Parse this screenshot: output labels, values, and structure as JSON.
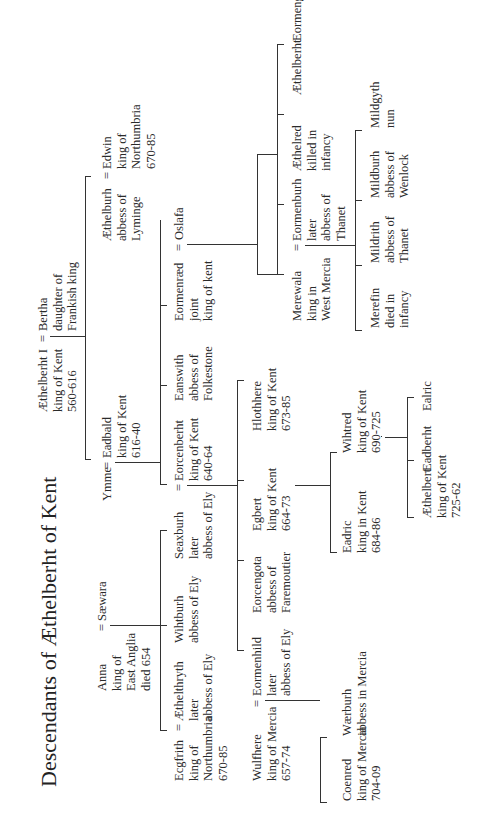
{
  "diagram": {
    "title": "Descendants of Æthelberht of Kent",
    "orientation": "rotated 90° counter-clockwise",
    "nodes": {
      "aethelberht": {
        "name": "Æthelberht I",
        "lines": "Æthelberht I\nking of Kent\n560-616"
      },
      "bertha": {
        "name": "Bertha",
        "lines": "Bertha\ndaughter of\nFrankish king"
      },
      "ymme": {
        "name": "Ymme",
        "lines": "Ymme"
      },
      "eadbald": {
        "name": "Eadbald",
        "lines": "Eadbald\nking of Kent\n616-40"
      },
      "aethelburh": {
        "name": "Æthelburh",
        "lines": "Æthelburh\nabbess of\nLyminge"
      },
      "edwin": {
        "name": "Edwin",
        "lines": "Edwin\nking of\nNorthumbria\n670-85"
      },
      "anna": {
        "name": "Anna",
        "lines": "Anna\nking of\nEast Anglia\ndied 654"
      },
      "saewara": {
        "name": "Sæwara",
        "lines": "Sæwara"
      },
      "ecgfrith": {
        "name": "Ecgfrith",
        "lines": "Ecgfrith\nking of\nNorthumbria\n670-85"
      },
      "aethelthryth": {
        "name": "Æthelthryth",
        "lines": "Æthelthryth\nlater\nabbess of Ely"
      },
      "wihtburh": {
        "name": "Wihtburh",
        "lines": "Wihtburh\nabbess of Ely"
      },
      "seaxburh": {
        "name": "Seaxburh",
        "lines": "Seaxburh\nlater\nabbess of Ely"
      },
      "eorcenberht": {
        "name": "Eorcenberht",
        "lines": "Eorcenberht\nking of Kent\n640-64"
      },
      "eanswith": {
        "name": "Eanswith",
        "lines": "Eanswith\nabbess of\nFolkestone"
      },
      "eormenraed": {
        "name": "Eormenræd",
        "lines": "Eormenræd\njoint\nking of kent"
      },
      "oslafa": {
        "name": "Oslafa",
        "lines": "Oslafa"
      },
      "wulfhere": {
        "name": "Wulfhere",
        "lines": "Wulfhere\nking of Mercia\n657-74"
      },
      "eormenhild": {
        "name": "Eormenhild",
        "lines": "Eormenhild\nlater\nabbess of Ely"
      },
      "eorcengota": {
        "name": "Eorcengota",
        "lines": "Eorcengota\nabbess of\nFaremoutier"
      },
      "egbert": {
        "name": "Egbert",
        "lines": "Egbert\nking of Kent\n664-73"
      },
      "hlothhere": {
        "name": "Hlothhere",
        "lines": "Hlothhere\nking of Kent\n673-85"
      },
      "merewala": {
        "name": "Merewala",
        "lines": "Merewala\nking in\nWest Mercia"
      },
      "eormenburh": {
        "name": "Eormenburh",
        "lines": "Eormenburh\nlater\nabbess of\nThanet"
      },
      "aethelred": {
        "name": "Æthelred",
        "lines": "Æthelred\nkilled in\ninfancy"
      },
      "aethelberht2": {
        "name": "Æthelberht",
        "lines": "Æthelberht"
      },
      "eormengyth": {
        "name": "Eormengyth",
        "lines": "Eormengyth"
      },
      "coenred": {
        "name": "Coenred",
        "lines": "Coenred\nking of Mercia\n704-09"
      },
      "waerburh": {
        "name": "Wærburh",
        "lines": "Wærburh\nabbess in Mercia"
      },
      "eadric": {
        "name": "Eadric",
        "lines": "Eadric\nking in Kent\n684-86"
      },
      "wihtred": {
        "name": "Wihtred",
        "lines": "Wihtred\nking of Kent\n690-725"
      },
      "aethelbert3": {
        "name": "Æthelbert",
        "lines": "Æthelbert\nking of Kent\n725-62"
      },
      "eadberht": {
        "name": "Eadberht",
        "lines": "Eadberht"
      },
      "ealric": {
        "name": "Ealric",
        "lines": "Ealric"
      },
      "merefin": {
        "name": "Merefin",
        "lines": "Merefin\ndied in\ninfancy"
      },
      "mildrith": {
        "name": "Mildrith",
        "lines": "Mildrith\nabbess of\nThanet"
      },
      "mildburh": {
        "name": "Mildburh",
        "lines": "Mildburh\nabbess of\nWenlock"
      },
      "mildgyth": {
        "name": "Mildgyth",
        "lines": "Mildgyth\nnun"
      }
    },
    "marriage_symbol": "="
  }
}
